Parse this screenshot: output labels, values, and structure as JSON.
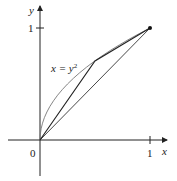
{
  "figure": {
    "curve_label": "x = y",
    "curve_label_exponent": "2",
    "axes": {
      "x_label": "x",
      "y_label": "y",
      "origin_label": "0",
      "x_tick_label": "1",
      "y_tick_label": "1"
    },
    "colors": {
      "axes": "#222222",
      "curve": "#777777",
      "chord": "#333333",
      "polygon": "#222222"
    }
  },
  "diagram_data": {
    "curve": "x = y^2",
    "domain_y": [
      0,
      1
    ],
    "chord": [
      [
        0,
        0
      ],
      [
        1,
        1
      ]
    ],
    "polygonal_path": [
      [
        0,
        0
      ],
      [
        0.5,
        0.7071
      ],
      [
        1,
        1
      ]
    ],
    "endpoint": [
      1,
      1
    ],
    "x_ticks": [
      1
    ],
    "y_ticks": [
      1
    ]
  }
}
